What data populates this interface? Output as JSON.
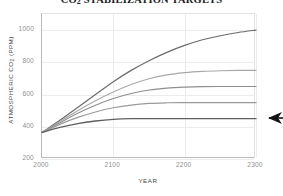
{
  "chart_data": {
    "type": "line",
    "title_main": "CO",
    "title_sub": "2",
    "title_rest": " STABILIZATION TARGETS",
    "xlabel": "YEAR",
    "ylabel": "ATMOSPHERIC CO₂ (PPM)",
    "ylabel_main": "ATMOSPHERIC CO",
    "ylabel_sub": "2",
    "ylabel_rest": " (PPM)",
    "xlim": [
      2000,
      2300
    ],
    "ylim": [
      200,
      1100
    ],
    "xticks": [
      "2000",
      "2100",
      "2200",
      "2300"
    ],
    "xtick_values": [
      2000,
      2100,
      2200,
      2300
    ],
    "yticks": [
      "200",
      "400",
      "600",
      "800",
      "1000"
    ],
    "ytick_values": [
      200,
      400,
      600,
      800,
      1000
    ],
    "grid": true,
    "legend": "none",
    "x": [
      2000,
      2025,
      2050,
      2075,
      2100,
      2125,
      2150,
      2175,
      2200,
      2225,
      2250,
      2275,
      2300
    ],
    "series": [
      {
        "name": "1000 ppm target",
        "color": "#6b6b6b",
        "width": 1.2,
        "plateau": 1000,
        "values": [
          365,
          440,
          520,
          600,
          680,
          750,
          810,
          862,
          905,
          940,
          965,
          985,
          1000
        ]
      },
      {
        "name": "750 ppm target",
        "color": "#a8a8a8",
        "width": 1.1,
        "plateau": 750,
        "values": [
          365,
          432,
          500,
          562,
          616,
          662,
          698,
          722,
          736,
          744,
          748,
          750,
          750
        ]
      },
      {
        "name": "650 ppm target",
        "color": "#8f8f8f",
        "width": 1.1,
        "plateau": 650,
        "values": [
          365,
          425,
          484,
          534,
          575,
          606,
          628,
          640,
          646,
          649,
          650,
          650,
          650
        ]
      },
      {
        "name": "550 ppm target",
        "color": "#9a9a9a",
        "width": 1.2,
        "plateau": 550,
        "values": [
          365,
          415,
          458,
          492,
          518,
          535,
          545,
          549,
          550,
          550,
          550,
          550,
          550
        ]
      },
      {
        "name": "450 ppm target",
        "color": "#5f5f5f",
        "width": 1.3,
        "plateau": 450,
        "values": [
          365,
          396,
          420,
          436,
          446,
          450,
          450,
          450,
          450,
          450,
          450,
          450,
          450
        ]
      }
    ],
    "annotations": [
      {
        "type": "arrow",
        "name": "target-arrow",
        "direction": "left",
        "color": "#141414",
        "points_at_series": "450 ppm target",
        "points_at_value": 450,
        "points_at_x": 2300
      }
    ]
  }
}
